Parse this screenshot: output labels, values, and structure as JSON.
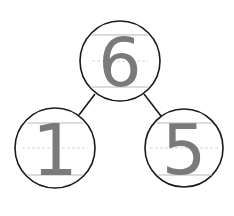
{
  "diagram": {
    "type": "number-bond",
    "whole": {
      "value": "6"
    },
    "parts": [
      {
        "value": "1"
      },
      {
        "value": "5"
      }
    ],
    "colors": {
      "outline": "#1a1a1a",
      "digit": "#7a7a7a",
      "guide_line": "#b8b8b8"
    }
  }
}
